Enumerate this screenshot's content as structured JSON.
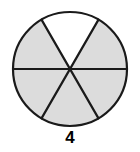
{
  "figure": {
    "type": "fraction-circle",
    "label": "4",
    "total_sectors": 6,
    "shaded_sectors": 5,
    "unshaded_sectors": 1,
    "fraction_shaded": "5/6",
    "geometry": {
      "center_x": 70,
      "center_y": 69,
      "radius": 57,
      "start_angle_deg": -120,
      "sector_angle_deg": 60
    },
    "colors": {
      "shaded_fill": "#dcdcdc",
      "unshaded_fill": "#ffffff",
      "stroke": "#1a1a1a",
      "background": "#ffffff",
      "label_color": "#000000"
    },
    "stroke_width": 2.2,
    "sectors": [
      {
        "index": 1,
        "name": "upper-left",
        "start_deg": -120,
        "end_deg": -60,
        "shaded": false
      },
      {
        "index": 2,
        "name": "right-upper",
        "start_deg": -60,
        "end_deg": 0,
        "shaded": true
      },
      {
        "index": 3,
        "name": "right-lower",
        "start_deg": 0,
        "end_deg": 60,
        "shaded": true
      },
      {
        "index": 4,
        "name": "bottom-right",
        "start_deg": 60,
        "end_deg": 120,
        "shaded": true
      },
      {
        "index": 5,
        "name": "bottom-left",
        "start_deg": 120,
        "end_deg": 180,
        "shaded": true
      },
      {
        "index": 6,
        "name": "left-lower",
        "start_deg": 180,
        "end_deg": 240,
        "shaded": true
      }
    ]
  }
}
